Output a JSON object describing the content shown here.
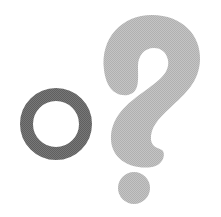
{
  "graphic": {
    "background_color": "#ffffff",
    "ring": {
      "icon": "circle-outline-icon",
      "color": "#6e6e6e",
      "cx": 56,
      "cy": 124,
      "outer_radius": 36,
      "stroke_width": 13
    },
    "question_mark": {
      "icon": "question-mark-icon",
      "color": "#bcbcbc",
      "dot": {
        "cx": 134,
        "cy": 188,
        "r": 16
      }
    }
  }
}
